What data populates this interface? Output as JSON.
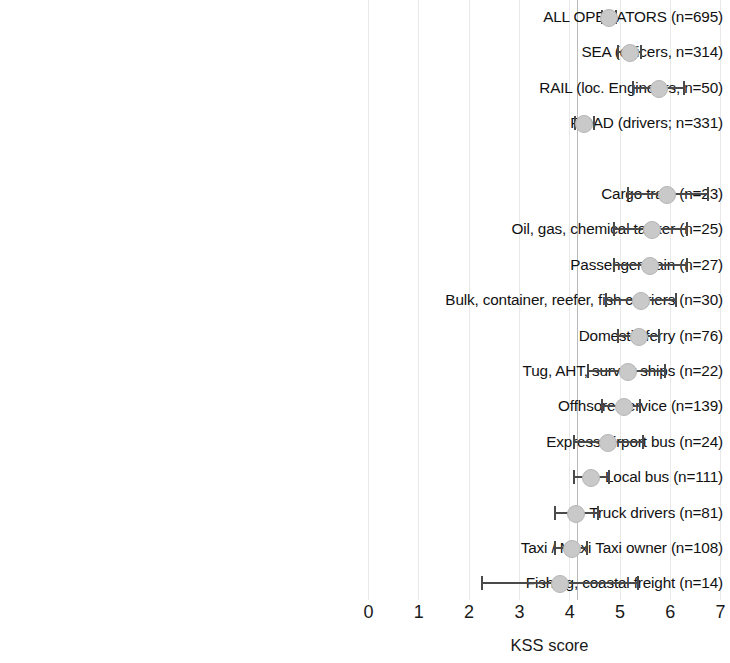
{
  "chart_data": {
    "type": "scatter",
    "title": "",
    "xlabel": "KSS score",
    "ylabel": "",
    "xlim": [
      0,
      7.2
    ],
    "xticks": [
      0,
      1,
      2,
      3,
      4,
      5,
      6,
      7
    ],
    "xtick_labels": [
      "0",
      "1",
      "2",
      "3",
      "4",
      "5",
      "6",
      "7"
    ],
    "grid": "vertical",
    "legend": "none",
    "reference_line": 4.15,
    "marker_color": "#c9c9c9",
    "errorbar_color": "#4a4a4a",
    "gridline_color": "#e8e8e8",
    "annotations": [],
    "categories": [
      "ALL OPERATORS (n=695)",
      "SEA (officers, n=314)",
      "RAIL (loc. Engineers, n=50)",
      "ROAD (drivers; n=331)",
      "Cargo train (n=23)",
      "Oil, gas, chemical tanker (n=25)",
      "Passenger train (n=27)",
      "Bulk, container, reefer, fish carriers (n=30)",
      "Domestic ferry (n=76)",
      "Tug, AHT, survey ships (n=22)",
      "Offhsore service (n=139)",
      "Express/airport bus (n=24)",
      "Local bus (n=111)",
      "Truck drivers (n=81)",
      "Taxi / Maxi Taxi owner (n=108)",
      "Fishing, coastal freight (n=14)"
    ],
    "values": [
      4.77,
      5.17,
      5.75,
      4.27,
      5.92,
      5.61,
      5.58,
      5.39,
      5.36,
      5.13,
      5.05,
      4.75,
      4.41,
      4.1,
      4.02,
      3.78
    ],
    "ci_low": [
      4.62,
      4.95,
      5.23,
      4.08,
      5.13,
      4.87,
      4.86,
      4.71,
      4.95,
      4.35,
      4.63,
      4.06,
      4.06,
      3.68,
      3.68,
      2.23
    ],
    "ci_high": [
      4.95,
      5.43,
      6.3,
      4.5,
      6.76,
      6.35,
      6.36,
      6.14,
      5.79,
      5.92,
      5.41,
      5.47,
      4.81,
      4.59,
      4.37,
      5.37
    ],
    "rows": [
      {
        "label": "ALL OPERATORS (n=695)",
        "value": 4.77,
        "ci_low": 4.62,
        "ci_high": 4.95,
        "group": "summary"
      },
      {
        "label": "SEA (officers, n=314)",
        "value": 5.17,
        "ci_low": 4.95,
        "ci_high": 5.43,
        "group": "summary"
      },
      {
        "label": "RAIL (loc. Engineers, n=50)",
        "value": 5.75,
        "ci_low": 5.23,
        "ci_high": 6.3,
        "group": "summary"
      },
      {
        "label": "ROAD (drivers; n=331)",
        "value": 4.27,
        "ci_low": 4.08,
        "ci_high": 4.5,
        "group": "summary"
      },
      {
        "label": "",
        "value": null,
        "ci_low": null,
        "ci_high": null,
        "group": "spacer"
      },
      {
        "label": "Cargo train (n=23)",
        "value": 5.92,
        "ci_low": 5.13,
        "ci_high": 6.76,
        "group": "detail"
      },
      {
        "label": "Oil, gas, chemical tanker (n=25)",
        "value": 5.61,
        "ci_low": 4.87,
        "ci_high": 6.35,
        "group": "detail"
      },
      {
        "label": "Passenger train (n=27)",
        "value": 5.58,
        "ci_low": 4.86,
        "ci_high": 6.36,
        "group": "detail"
      },
      {
        "label": "Bulk, container, reefer, fish carriers (n=30)",
        "value": 5.39,
        "ci_low": 4.71,
        "ci_high": 6.14,
        "group": "detail"
      },
      {
        "label": "Domestic ferry (n=76)",
        "value": 5.36,
        "ci_low": 4.95,
        "ci_high": 5.79,
        "group": "detail"
      },
      {
        "label": "Tug, AHT, survey ships (n=22)",
        "value": 5.13,
        "ci_low": 4.35,
        "ci_high": 5.92,
        "group": "detail"
      },
      {
        "label": "Offhsore service (n=139)",
        "value": 5.05,
        "ci_low": 4.63,
        "ci_high": 5.41,
        "group": "detail"
      },
      {
        "label": "Express/airport bus (n=24)",
        "value": 4.75,
        "ci_low": 4.06,
        "ci_high": 5.47,
        "group": "detail"
      },
      {
        "label": "Local bus (n=111)",
        "value": 4.41,
        "ci_low": 4.06,
        "ci_high": 4.81,
        "group": "detail"
      },
      {
        "label": "Truck drivers (n=81)",
        "value": 4.1,
        "ci_low": 3.68,
        "ci_high": 4.59,
        "group": "detail"
      },
      {
        "label": "Taxi / Maxi Taxi owner (n=108)",
        "value": 4.02,
        "ci_low": 3.68,
        "ci_high": 4.37,
        "group": "detail"
      },
      {
        "label": "Fishing, coastal freight (n=14)",
        "value": 3.78,
        "ci_low": 2.23,
        "ci_high": 5.37,
        "group": "detail"
      }
    ]
  }
}
